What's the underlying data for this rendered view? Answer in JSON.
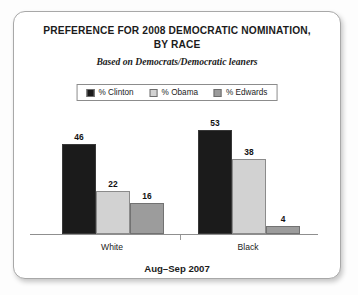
{
  "chart_data": {
    "type": "bar",
    "title": "PREFERENCE FOR 2008 DEMOCRATIC NOMINATION, BY RACE",
    "title_lines": [
      "PREFERENCE FOR 2008 DEMOCRATIC NOMINATION,",
      "BY RACE"
    ],
    "subtitle": "Based on Democrats/Democratic leaners",
    "caption": "Aug–Sep 2007",
    "categories": [
      "White",
      "Black"
    ],
    "xlabel": "",
    "ylabel": "",
    "ylim": [
      0,
      60
    ],
    "grid": false,
    "legend_position": "top-center",
    "series": [
      {
        "name": "% Clinton",
        "values": [
          46,
          53
        ],
        "color": "#1b1b1b"
      },
      {
        "name": "% Obama",
        "values": [
          22,
          38
        ],
        "color": "#d2d2d2"
      },
      {
        "name": "% Edwards",
        "values": [
          16,
          4
        ],
        "color": "#9c9c9c"
      }
    ]
  },
  "legend": {
    "items": [
      {
        "label": "% Clinton",
        "color": "#1b1b1b"
      },
      {
        "label": "% Obama",
        "color": "#d2d2d2"
      },
      {
        "label": "% Edwards",
        "color": "#9c9c9c"
      }
    ]
  }
}
